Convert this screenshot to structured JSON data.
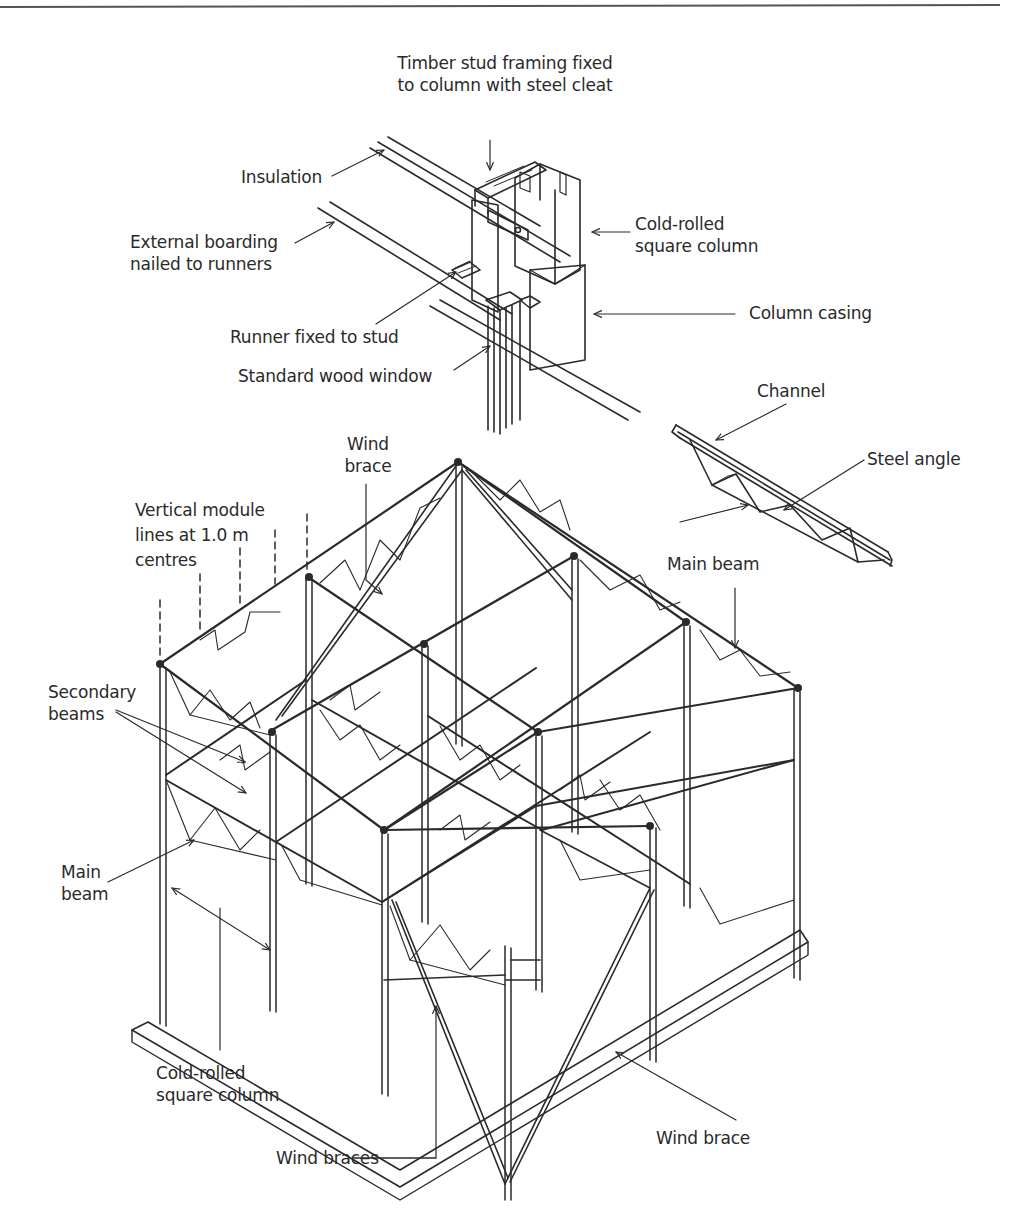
{
  "figure": {
    "type": "isometric structural framing diagram"
  },
  "labels": {
    "timber_stud": [
      "Timber stud framing fixed",
      "to column with steel cleat"
    ],
    "insulation": [
      "Insulation"
    ],
    "external_boarding": [
      "External boarding",
      "nailed to runners"
    ],
    "cold_rolled_top": [
      "Cold-rolled",
      "square column"
    ],
    "column_casing": [
      "Column casing"
    ],
    "runner": [
      "Runner fixed to stud"
    ],
    "wood_window": [
      "Standard wood window"
    ],
    "channel": [
      "Channel"
    ],
    "steel_angle": [
      "Steel angle"
    ],
    "main_beam_detail": [
      "Main beam"
    ],
    "wind_brace_top": [
      "Wind",
      "brace"
    ],
    "module_lines": [
      "Vertical module",
      "lines at 1.0 m",
      "centres"
    ],
    "secondary_beams": [
      "Secondary",
      "beams"
    ],
    "main_beam_left": [
      "Main",
      "beam"
    ],
    "cold_rolled_bottom": [
      "Cold-rolled",
      "square column"
    ],
    "wind_braces_bottom": [
      "Wind braces"
    ],
    "wind_brace_bottom": [
      "Wind brace"
    ]
  },
  "colors": {
    "ink": "#2a2a2a",
    "paper": "#ffffff",
    "rule": "#555555"
  }
}
